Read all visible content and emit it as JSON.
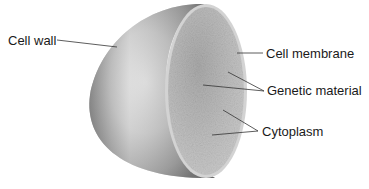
{
  "diagram": {
    "labels": [
      {
        "id": "cell-wall",
        "text": "Cell wall"
      },
      {
        "id": "cell-membrane",
        "text": "Cell membrane"
      },
      {
        "id": "genetic-material",
        "text": "Genetic material"
      },
      {
        "id": "cytoplasm",
        "text": "Cytoplasm"
      }
    ],
    "colors": {
      "shell_light": "#e6e6e6",
      "shell_mid": "#a8a8a8",
      "shell_dark": "#5a5a5a",
      "cut_face": "#b9b9b9",
      "cut_rim": "#d0d0d0",
      "leader_line": "#333333",
      "text": "#1a1a1a"
    }
  }
}
